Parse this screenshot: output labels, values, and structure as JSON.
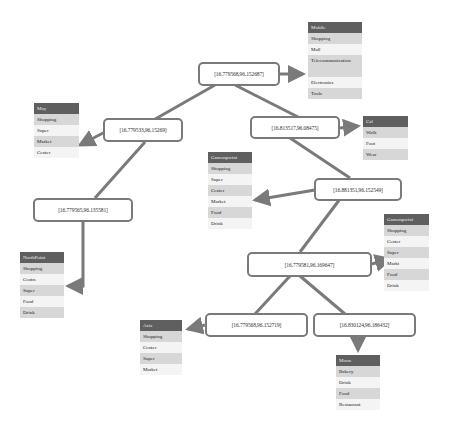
{
  "colors": {
    "edge": "#7a7a7a",
    "node_border": "#7a7a7a",
    "card_header": "#5f5f5f",
    "card_row_shaded": "#d7d7d7",
    "card_row_light": "#f4f4f4"
  },
  "nodes": [
    {
      "id": "n1",
      "label": "[16.779568,96.152687]"
    },
    {
      "id": "n2",
      "label": "[16.779533,96.15269]"
    },
    {
      "id": "n3",
      "label": "[16.813517,96.08475]"
    },
    {
      "id": "n4",
      "label": "[16.779565,96.135581]"
    },
    {
      "id": "n5",
      "label": "[16.881351,96.152549]"
    },
    {
      "id": "n6",
      "label": "[16.779581,96.169647]"
    },
    {
      "id": "n7",
      "label": "[16.779568,96.152719]"
    },
    {
      "id": "n8",
      "label": "[16.830124,96.186432]"
    }
  ],
  "cards": [
    {
      "id": "c_mobile",
      "title": "Mobile",
      "items": [
        "Shopping",
        "Mall",
        "Telecommunication",
        "Electronics",
        "Tools"
      ]
    },
    {
      "id": "c_may",
      "title": "May",
      "items": [
        "Shopping",
        "Super",
        "Market",
        "Center"
      ]
    },
    {
      "id": "c_cal",
      "title": "Cal",
      "items": [
        "Walk",
        "Foot",
        "Wear"
      ]
    },
    {
      "id": "c_gamonpwint1",
      "title": "Gamonpwint",
      "items": [
        "Shopping",
        "Super",
        "Center",
        "Market",
        "Food",
        "Drink"
      ]
    },
    {
      "id": "c_gamonpwint2",
      "title": "Gamonpwint",
      "items": [
        "Shopping",
        "Center",
        "Super",
        "Markt",
        "Food",
        "Drink"
      ]
    },
    {
      "id": "c_northpoint",
      "title": "NorthPoint",
      "items": [
        "Shopping",
        "Centre",
        "Super",
        "Food",
        "Drink"
      ]
    },
    {
      "id": "c_asia",
      "title": "Asia",
      "items": [
        "Shopping",
        "Center",
        "Super",
        "Market"
      ]
    },
    {
      "id": "c_moon",
      "title": "Moon",
      "items": [
        "Bakery",
        "Drink",
        "Food",
        "Restaurant"
      ]
    }
  ]
}
